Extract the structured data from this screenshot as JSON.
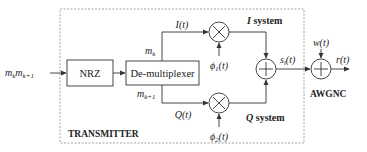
{
  "diagram": {
    "title": "TRANSMITTER",
    "input_label": {
      "base1": "m",
      "sub1": "k",
      "base2": "m",
      "sub2": "k+1"
    },
    "blocks": {
      "nrz": "NRZ",
      "demux": "De-multiplexer"
    },
    "demux_outputs": {
      "top": {
        "base": "m",
        "sub": "k"
      },
      "bottom": {
        "base": "m",
        "sub": "k+1"
      }
    },
    "signals": {
      "i_signal": "I(t)",
      "q_signal": "Q(t)",
      "phi1": {
        "base": "ϕ",
        "sub": "1",
        "tail": "(t)"
      },
      "phi2": {
        "base": "ϕ",
        "sub": "2",
        "tail": "(t)"
      },
      "sum_output": {
        "base": "s",
        "sub": "i",
        "tail": "(t)"
      },
      "noise": "w(t)",
      "received": "r(t)"
    },
    "branch_labels": {
      "i_system": {
        "var": "I",
        "text": " system"
      },
      "q_system": {
        "var": "Q",
        "text": " system"
      }
    },
    "channel_label": "AWGNC",
    "operators": {
      "multiply": "×",
      "add": "+"
    },
    "colors": {
      "line": "#333333",
      "dashed_border": "#999999",
      "text": "#222222"
    }
  }
}
